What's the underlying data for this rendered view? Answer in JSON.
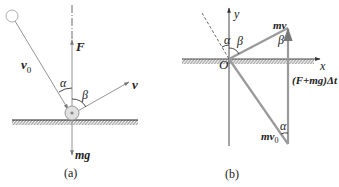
{
  "figure": {
    "panel_a": {
      "caption": "(a)",
      "labels": {
        "initial_velocity": "v",
        "initial_velocity_sub": "0",
        "force": "F",
        "final_velocity": "v",
        "gravity": "mg",
        "angle_alpha": "α",
        "angle_beta": "β"
      }
    },
    "panel_b": {
      "caption": "(b)",
      "labels": {
        "y_axis": "y",
        "x_axis": "x",
        "origin": "O",
        "final_momentum": "mv",
        "initial_momentum": "mv",
        "initial_momentum_sub": "0",
        "impulse": "(F+mg)Δt",
        "angle_alpha_top": "α",
        "angle_beta_top": "β",
        "angle_beta_right": "β",
        "angle_alpha_bottom": "α"
      }
    },
    "colors": {
      "line": "#8a8a8a",
      "thick_line": "#9a9a9a",
      "text": "#222222",
      "ball_fill": "#d8d8d8"
    }
  }
}
